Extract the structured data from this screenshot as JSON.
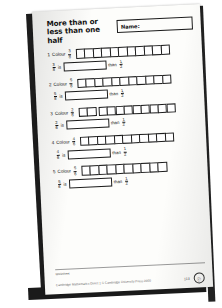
{
  "worksheet": {
    "title": "More than or less than one half",
    "name_label": "Name:",
    "questions": [
      {
        "number": "1",
        "colour_word": "Colour",
        "fraction": {
          "numerator": "3",
          "denominator": "8"
        },
        "cells": 11,
        "gap_after": null,
        "is_word": "is",
        "than_word": "than",
        "half": {
          "numerator": "1",
          "denominator": "2"
        }
      },
      {
        "number": "2",
        "colour_word": "Colour",
        "fraction": {
          "numerator": "5",
          "denominator": "8"
        },
        "cells": 11,
        "gap_after": null,
        "is_word": "is",
        "than_word": "than",
        "half": {
          "numerator": "1",
          "denominator": "2"
        }
      },
      {
        "number": "3",
        "colour_word": "Colour",
        "fraction": {
          "numerator": "2",
          "denominator": "6"
        },
        "cells": 11,
        "gap_after": 2,
        "is_word": "is",
        "than_word": "than",
        "half": {
          "numerator": "1",
          "denominator": "2"
        }
      },
      {
        "number": "4",
        "colour_word": "Colour",
        "fraction": {
          "numerator": "4",
          "denominator": "6"
        },
        "cells": 11,
        "gap_after": null,
        "is_word": "is",
        "than_word": "than",
        "half": {
          "numerator": "1",
          "denominator": "2"
        }
      },
      {
        "number": "5",
        "colour_word": "Colour",
        "fraction": {
          "numerator": "5",
          "denominator": "6"
        },
        "cells": 10,
        "gap_after": null,
        "is_word": "is",
        "than_word": "than",
        "half": {
          "numerator": "1",
          "denominator": "2"
        }
      }
    ],
    "footer": {
      "tag": "Worksheet",
      "credit": "Cambridge Mathematics Direct 1  © Cambridge University Press 2000",
      "page_number": "113",
      "badge_glyph": "ⓒ"
    }
  }
}
